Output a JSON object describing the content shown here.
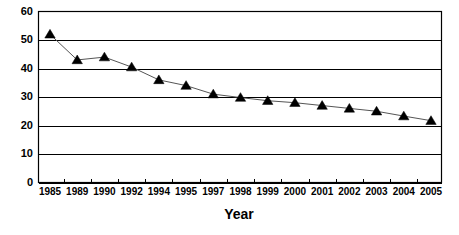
{
  "chart_data": {
    "type": "line",
    "title": "",
    "subtitle": "",
    "xlabel": "Year",
    "ylabel": "",
    "categories": [
      "1985",
      "1989",
      "1990",
      "1992",
      "1994",
      "1995",
      "1997",
      "1998",
      "1999",
      "2000",
      "2001",
      "2002",
      "2003",
      "2004",
      "2005"
    ],
    "values": [
      52,
      43,
      44,
      40.5,
      36,
      34,
      31,
      29.8,
      28.7,
      28,
      27,
      26,
      25,
      23.3,
      21.7
    ],
    "series": [
      {
        "name": "",
        "values": [
          52,
          43,
          44,
          40.5,
          36,
          34,
          31,
          29.8,
          28.7,
          28,
          27,
          26,
          25,
          23.3,
          21.7
        ]
      }
    ],
    "ylim": [
      0,
      60
    ],
    "yticks": [
      0,
      10,
      20,
      30,
      40,
      50,
      60
    ],
    "ytick_labels": [
      "0",
      "10",
      "20",
      "30",
      "40",
      "50",
      "60"
    ],
    "grid": "horizontal",
    "legend": "none",
    "marker": "triangle",
    "colors": {
      "line": "#555555",
      "marker": "#000000",
      "grid": "#000000",
      "axis": "#000000",
      "background": "#ffffff"
    },
    "annotations": []
  },
  "axes": {
    "x_title": "Year",
    "y_title": ""
  }
}
